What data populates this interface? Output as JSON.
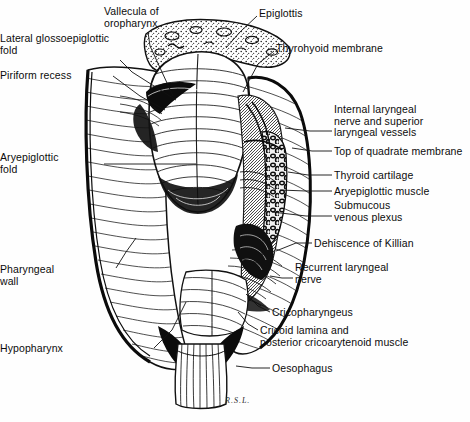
{
  "figure": {
    "signature": "R.S.L.",
    "ink_color": "#111111",
    "background_color": "#fefefe"
  },
  "labels": [
    {
      "id": "vallecula-of-oropharynx",
      "text": "Vallecula of\noropharynx",
      "align": "left",
      "x": 104,
      "y": 6,
      "leader": [
        [
          148,
          32
        ],
        [
          150,
          46
        ],
        [
          173,
          96
        ]
      ]
    },
    {
      "id": "lateral-glossoepiglottic-fold",
      "text": "Lateral glossoepiglottic\nfold",
      "align": "right",
      "x": 4,
      "y": 33,
      "leader": [
        [
          120,
          60
        ],
        [
          132,
          72
        ],
        [
          176,
          100
        ]
      ]
    },
    {
      "id": "piriform-recess",
      "text": "Piriform recess",
      "align": "right",
      "x": 4,
      "y": 70,
      "leader": [
        [
          113,
          76
        ],
        [
          140,
          96
        ],
        [
          165,
          110
        ]
      ]
    },
    {
      "id": "epiglottis",
      "text": "Epiglottis",
      "align": "left",
      "x": 259,
      "y": 8,
      "leader": [
        [
          257,
          16
        ],
        [
          240,
          32
        ],
        [
          226,
          48
        ]
      ]
    },
    {
      "id": "thyrohyoid-membrane",
      "text": "Thyrohyoid membrane",
      "align": "left",
      "x": 276,
      "y": 43,
      "leader": [
        [
          274,
          51
        ],
        [
          258,
          64
        ],
        [
          243,
          92
        ]
      ]
    },
    {
      "id": "internal-laryngeal-nerve-and-superior-laryngeal-vessels",
      "text": "Internal laryngeal\nnerve and superior\nlaryngeal vessels",
      "align": "left",
      "x": 334,
      "y": 104,
      "leader": [
        [
          332,
          131
        ],
        [
          310,
          131
        ],
        [
          285,
          128
        ]
      ]
    },
    {
      "id": "top-of-quadrate-membrane",
      "text": "Top of quadrate membrane",
      "align": "left",
      "x": 334,
      "y": 146,
      "leader": [
        [
          332,
          151
        ],
        [
          312,
          151
        ],
        [
          292,
          148
        ]
      ]
    },
    {
      "id": "thyroid-cartilage",
      "text": "Thyroid cartilage",
      "align": "left",
      "x": 334,
      "y": 170,
      "leader": [
        [
          332,
          175
        ],
        [
          308,
          175
        ],
        [
          288,
          172
        ]
      ]
    },
    {
      "id": "aryepiglottic-muscle",
      "text": "Aryepiglottic muscle",
      "align": "left",
      "x": 334,
      "y": 186,
      "leader": [
        [
          332,
          191
        ],
        [
          306,
          191
        ],
        [
          280,
          190
        ]
      ]
    },
    {
      "id": "submucous-venous-plexus",
      "text": "Submucous\nvenous plexus",
      "align": "left",
      "x": 334,
      "y": 200,
      "leader": [
        [
          332,
          216
        ],
        [
          306,
          216
        ],
        [
          272,
          212
        ]
      ]
    },
    {
      "id": "dehiscence-of-killian",
      "text": "Dehiscence of Killian",
      "align": "left",
      "x": 314,
      "y": 238,
      "leader": [
        [
          312,
          243
        ],
        [
          296,
          243
        ],
        [
          276,
          251
        ]
      ]
    },
    {
      "id": "recurrent-laryngeal-nerve",
      "text": "Recurrent laryngeal\nnerve",
      "align": "left",
      "x": 295,
      "y": 262,
      "leader": [
        [
          293,
          278
        ],
        [
          282,
          278
        ],
        [
          270,
          276
        ]
      ]
    },
    {
      "id": "cricopharyngeus",
      "text": "Cricopharyngeus",
      "align": "left",
      "x": 272,
      "y": 307,
      "leader": [
        [
          270,
          312
        ],
        [
          258,
          306
        ],
        [
          246,
          294
        ]
      ]
    },
    {
      "id": "cricoid-lamina-and-posterior-cricoarytenoid-muscle",
      "text": "Cricoid lamina and\nposterior cricoarytenoid muscle",
      "align": "left",
      "x": 260,
      "y": 325,
      "leader": [
        [
          258,
          330
        ],
        [
          248,
          324
        ],
        [
          238,
          312
        ]
      ]
    },
    {
      "id": "oesophagus",
      "text": "Oesophagus",
      "align": "left",
      "x": 272,
      "y": 363,
      "leader": [
        [
          270,
          368
        ],
        [
          252,
          368
        ],
        [
          236,
          366
        ]
      ]
    },
    {
      "id": "aryepiglottic-fold",
      "text": "Aryepiglottic\nfold",
      "align": "right",
      "x": 4,
      "y": 152,
      "leader": [
        [
          104,
          164
        ],
        [
          170,
          164
        ],
        [
          196,
          164
        ]
      ]
    },
    {
      "id": "pharyngeal-wall",
      "text": "Pharyngeal\nwall",
      "align": "right",
      "x": 4,
      "y": 264,
      "leader": [
        [
          116,
          268
        ],
        [
          126,
          252
        ],
        [
          136,
          238
        ]
      ]
    },
    {
      "id": "hypopharynx",
      "text": "Hypopharynx",
      "align": "right",
      "x": 4,
      "y": 343,
      "leader": [
        [
          154,
          348
        ],
        [
          172,
          330
        ],
        [
          186,
          302
        ]
      ]
    }
  ]
}
